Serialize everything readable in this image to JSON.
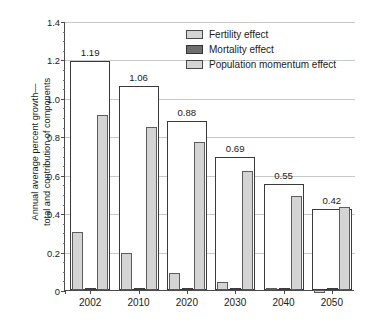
{
  "chart_data": {
    "type": "bar",
    "title": "",
    "xlabel": "",
    "ylabel": "Annual average percent growth— total and contribution of components",
    "ylabel_line1": "Annual average percent growth—",
    "ylabel_line2": "total and contribution of components",
    "categories": [
      "2002",
      "2010",
      "2020",
      "2030",
      "2040",
      "2050"
    ],
    "ylim": [
      0,
      1.4
    ],
    "ytick_labels": [
      "0",
      "0.2",
      "0.4",
      "0.6",
      "0.8",
      "1.0",
      "1.2",
      "1.4"
    ],
    "ytick_values": [
      0,
      0.2,
      0.4,
      0.6,
      0.8,
      1.0,
      1.2,
      1.4
    ],
    "grid": "horizontal",
    "legend_position": "top-right",
    "totals": [
      1.19,
      1.06,
      0.88,
      0.69,
      0.55,
      0.42
    ],
    "total_labels": [
      "1.19",
      "1.06",
      "0.88",
      "0.69",
      "0.55",
      "0.42"
    ],
    "series": [
      {
        "name": "Fertility effect",
        "color": "#d4d4d4",
        "values": [
          0.3,
          0.19,
          0.09,
          0.04,
          0.012,
          -0.015
        ]
      },
      {
        "name": "Mortality effect",
        "color": "#6e6e6e",
        "values": [
          0.012,
          0.01,
          0.008,
          0.008,
          0.008,
          0.01
        ]
      },
      {
        "name": "Population momentum effect",
        "color": "#d4d4d4",
        "values": [
          0.91,
          0.85,
          0.77,
          0.62,
          0.49,
          0.43
        ]
      }
    ]
  },
  "legend": {
    "items": [
      {
        "label": "Fertility effect",
        "swatch": "fertility-swatch"
      },
      {
        "label": "Mortality effect",
        "swatch": "mortality-swatch"
      },
      {
        "label": "Population momentum effect",
        "swatch": "momentum-swatch"
      }
    ]
  }
}
